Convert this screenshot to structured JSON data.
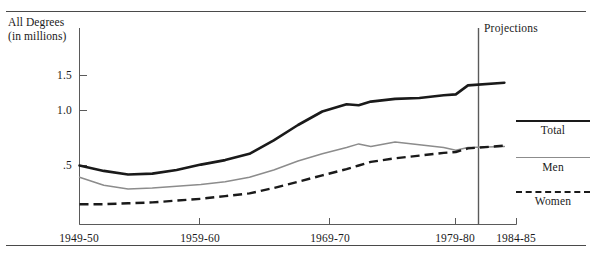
{
  "figure": {
    "y_axis_title_line1": "All Degrees",
    "y_axis_title_line2": "(in millions)",
    "projections_label": "Projections"
  },
  "legend": {
    "items": [
      {
        "label": "Total",
        "style": "thick-solid-black",
        "color": "#1a1a1a"
      },
      {
        "label": "Men",
        "style": "thin-solid-gray",
        "color": "#8c8c8c"
      },
      {
        "label": "Women",
        "style": "dashed-black",
        "color": "#1a1a1a"
      }
    ]
  },
  "chart_data": {
    "type": "line",
    "title": "",
    "subtitle": "",
    "xlabel": "",
    "ylabel": "All Degrees (in millions)",
    "ylim": [
      0.0,
      1.75
    ],
    "xlim": [
      1949,
      1985
    ],
    "grid": false,
    "legend_position": "right",
    "ytick_labels": [
      "1.5",
      "1.0",
      ".5"
    ],
    "ytick_values": [
      1.5,
      1.0,
      0.5
    ],
    "xtick_labels": [
      "1949-50",
      "1959-60",
      "1969-70",
      "1979-80",
      "1984-85"
    ],
    "xtick_values": [
      1949,
      1959,
      1969,
      1979,
      1984
    ],
    "annotations": [
      {
        "text": "Projections",
        "type": "vertical-divider",
        "x": 1980.5
      }
    ],
    "x": [
      1949,
      1951,
      1953,
      1955,
      1957,
      1959,
      1961,
      1963,
      1965,
      1967,
      1969,
      1971,
      1972,
      1973,
      1975,
      1977,
      1979,
      1980,
      1981,
      1984
    ],
    "series": [
      {
        "name": "Total",
        "color": "#1a1a1a",
        "style": "thick-solid",
        "values": [
          0.5,
          0.44,
          0.4,
          0.41,
          0.45,
          0.51,
          0.56,
          0.63,
          0.78,
          0.95,
          1.1,
          1.18,
          1.17,
          1.21,
          1.24,
          1.25,
          1.28,
          1.29,
          1.39,
          1.42
        ]
      },
      {
        "name": "Men",
        "color": "#8c8c8c",
        "style": "thin-solid",
        "values": [
          0.37,
          0.28,
          0.24,
          0.25,
          0.27,
          0.29,
          0.32,
          0.37,
          0.45,
          0.55,
          0.63,
          0.7,
          0.74,
          0.71,
          0.76,
          0.73,
          0.7,
          0.67,
          0.7,
          0.71
        ]
      },
      {
        "name": "Women",
        "color": "#1a1a1a",
        "style": "dashed",
        "values": [
          0.07,
          0.07,
          0.08,
          0.09,
          0.11,
          0.13,
          0.16,
          0.19,
          0.25,
          0.32,
          0.39,
          0.46,
          0.5,
          0.54,
          0.58,
          0.61,
          0.64,
          0.65,
          0.69,
          0.72
        ]
      }
    ]
  }
}
